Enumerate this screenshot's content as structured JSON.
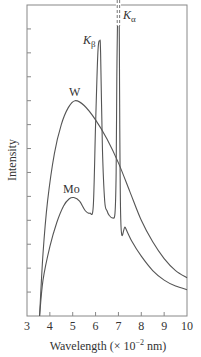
{
  "chart_data": {
    "type": "line",
    "title": "",
    "xlabel": "Wavelength (× 10⁻² nm)",
    "xlabel_parts": {
      "prefix": "Wavelength (× 10",
      "exp": "−2",
      "suffix": " nm)"
    },
    "ylabel": "Intensity",
    "xlim": [
      3,
      10
    ],
    "ylim": [
      0,
      13
    ],
    "x_ticks": [
      3,
      4,
      5,
      6,
      7,
      8,
      9,
      10
    ],
    "y_ticks_count": 12,
    "y_tick_labels": false,
    "grid": false,
    "legend": null,
    "series": [
      {
        "name": "W",
        "label": "W",
        "color": "#555555",
        "x": [
          3.55,
          3.7,
          3.9,
          4.2,
          4.5,
          4.8,
          5.1,
          5.5,
          6.0,
          6.5,
          7.0,
          7.5,
          8.0,
          8.5,
          9.0,
          9.5,
          10.0
        ],
        "y": [
          0.0,
          2.6,
          4.8,
          6.8,
          8.0,
          8.7,
          9.0,
          8.8,
          8.2,
          7.4,
          6.4,
          5.2,
          4.0,
          3.1,
          2.4,
          1.9,
          1.6
        ]
      },
      {
        "name": "Mo",
        "label": "Mo",
        "color": "#555555",
        "x": [
          3.55,
          3.7,
          4.0,
          4.3,
          4.6,
          4.85,
          5.05,
          5.3,
          5.55,
          5.75,
          5.9,
          6.0,
          6.1,
          6.18,
          6.22,
          6.3,
          6.4,
          6.5,
          6.6,
          6.75,
          6.85,
          6.9,
          6.93,
          6.97,
          7.0,
          7.03,
          7.1,
          7.3,
          7.6,
          8.0,
          8.5,
          9.0,
          9.5,
          10.0
        ],
        "y": [
          0.0,
          1.5,
          2.9,
          3.9,
          4.6,
          4.9,
          4.95,
          4.8,
          4.4,
          4.3,
          4.6,
          8.0,
          11.0,
          11.5,
          11.0,
          7.0,
          4.8,
          4.4,
          4.2,
          4.1,
          4.3,
          6.0,
          10.0,
          13.0,
          13.5,
          13.0,
          4.1,
          3.7,
          3.1,
          2.5,
          1.9,
          1.5,
          1.25,
          1.1
        ]
      }
    ],
    "annotations": [
      {
        "text": "Kβ",
        "base": "K",
        "sub": "β",
        "x": 6.2,
        "y": 11.5
      },
      {
        "text": "Kα",
        "base": "K",
        "sub": "α",
        "x": 7.0,
        "y": 13.0,
        "note": "peak extends off chart (dashed)"
      },
      {
        "text": "W",
        "x": 5.1,
        "y": 9.0
      },
      {
        "text": "Mo",
        "x": 4.9,
        "y": 5.0
      }
    ]
  }
}
